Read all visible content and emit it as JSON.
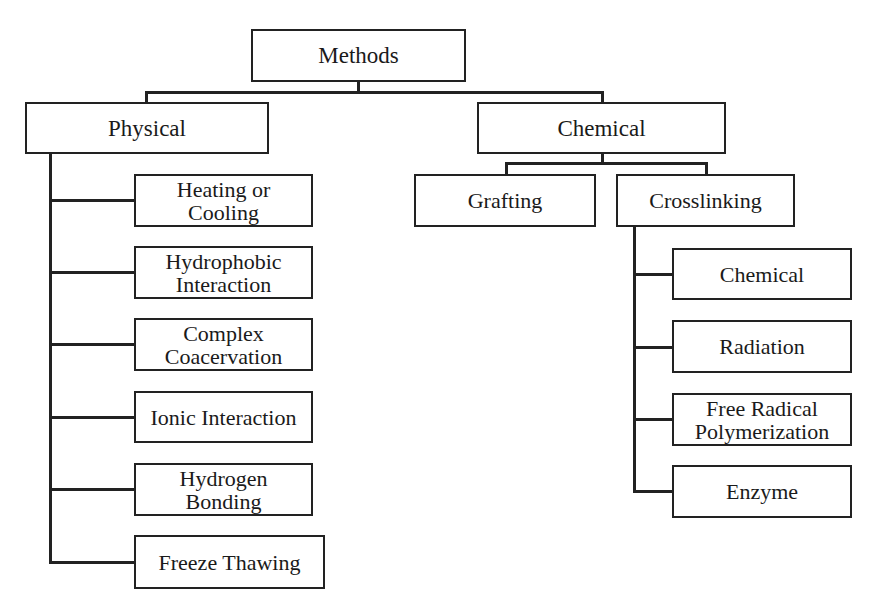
{
  "diagram": {
    "type": "tree",
    "root": {
      "label": "Methods"
    },
    "branches": [
      {
        "label": "Physical",
        "children": [
          {
            "label": "Heating or Cooling",
            "line1": "Heating or",
            "line2": "Cooling"
          },
          {
            "label": "Hydrophobic Interaction",
            "line1": "Hydrophobic",
            "line2": "Interaction"
          },
          {
            "label": "Complex Coacervation",
            "line1": "Complex",
            "line2": "Coacervation"
          },
          {
            "label": "Ionic Interaction"
          },
          {
            "label": "Hydrogen Bonding",
            "line1": "Hydrogen",
            "line2": "Bonding"
          },
          {
            "label": "Freeze Thawing"
          }
        ]
      },
      {
        "label": "Chemical",
        "children": [
          {
            "label": "Grafting"
          },
          {
            "label": "Crosslinking",
            "children": [
              {
                "label": "Chemical"
              },
              {
                "label": "Radiation"
              },
              {
                "label": "Free Radical Polymerization",
                "line1": "Free Radical",
                "line2": "Polymerization"
              },
              {
                "label": "Enzyme"
              }
            ]
          }
        ]
      }
    ]
  },
  "colors": {
    "line": "#222222",
    "background": "#ffffff",
    "text": "#1a1a1a"
  }
}
